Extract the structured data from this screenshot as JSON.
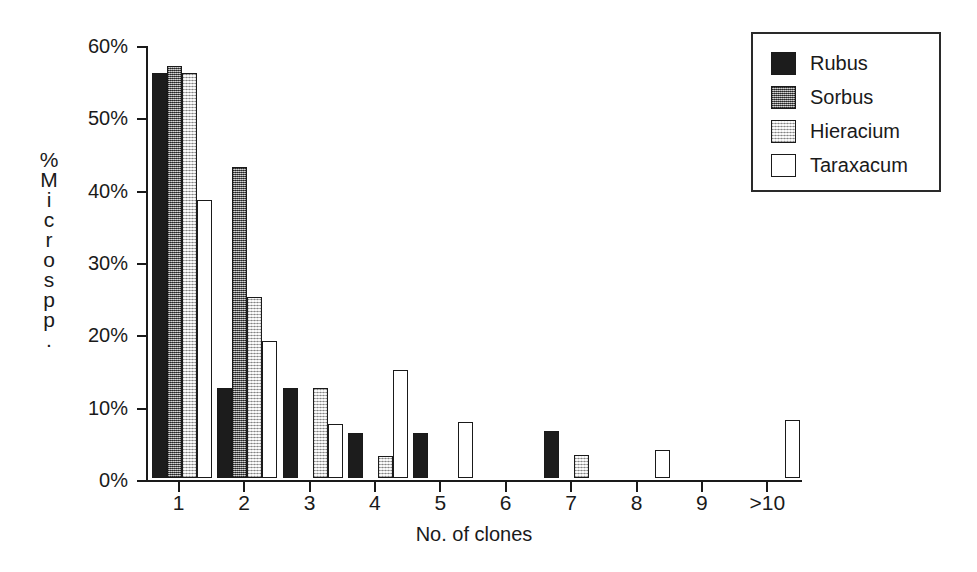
{
  "chart_data": {
    "type": "bar",
    "title": "",
    "subtitle": "",
    "xlabel": "No. of clones",
    "ylabel": "% Microspp.",
    "ylabel_chars": [
      "%",
      "M",
      "i",
      "c",
      "r",
      "o",
      "s",
      "p",
      "p",
      "."
    ],
    "categories": [
      "1",
      "2",
      "3",
      "4",
      "5",
      "6",
      "7",
      "8",
      "9",
      ">10"
    ],
    "ylim": [
      0,
      60
    ],
    "ytick_values": [
      0,
      10,
      20,
      30,
      40,
      50,
      60
    ],
    "ytick_labels": [
      "0%",
      "10%",
      "20%",
      "30%",
      "40%",
      "50%",
      "60%"
    ],
    "grid": false,
    "legend_position": "top-right",
    "series": [
      {
        "name": "Rubus",
        "color": "#1c1c1c",
        "fill": "solid-black",
        "values": [
          56,
          12.5,
          12.5,
          6.25,
          6.25,
          0,
          6.5,
          0,
          0,
          0
        ]
      },
      {
        "name": "Sorbus",
        "color": "#8d8d8d",
        "fill": "dense-gray-dither",
        "values": [
          57,
          43,
          0,
          0,
          0,
          0,
          0,
          0,
          0,
          0
        ]
      },
      {
        "name": "Hieracium",
        "color": "#dedede",
        "fill": "light-gray-dither",
        "values": [
          56,
          25,
          12.5,
          3.1,
          0,
          0,
          3.2,
          0,
          0,
          0
        ]
      },
      {
        "name": "Taraxacum",
        "color": "#ffffff",
        "fill": "white-outline",
        "values": [
          38.5,
          19,
          7.5,
          15,
          7.8,
          0,
          0,
          3.9,
          0,
          8
        ]
      }
    ]
  },
  "legend": {
    "items": [
      {
        "label": "Rubus"
      },
      {
        "label": "Sorbus"
      },
      {
        "label": "Hieracium"
      },
      {
        "label": "Taraxacum"
      }
    ]
  }
}
